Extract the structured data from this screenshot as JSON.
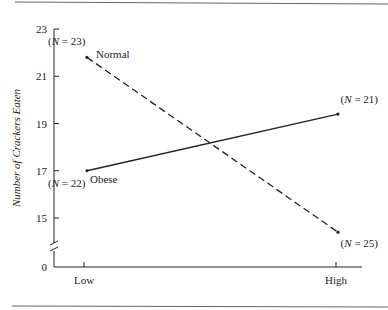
{
  "chart_data": {
    "type": "line",
    "title": "",
    "xlabel": "",
    "ylabel": "Number of Crackers Eaten",
    "categories": [
      "Low",
      "High"
    ],
    "series": [
      {
        "name": "Normal",
        "style": "dashed",
        "values": [
          21.8,
          14.4
        ],
        "n_labels": [
          "(N = 23)",
          "(N = 25)"
        ]
      },
      {
        "name": "Obese",
        "style": "solid",
        "values": [
          17.0,
          19.4
        ],
        "n_labels": [
          "(N = 22)",
          "(N = 21)"
        ]
      }
    ],
    "yticks": [
      0,
      15,
      17,
      19,
      21,
      23
    ],
    "ylim": [
      14,
      23
    ],
    "axis_break": true,
    "grid": false,
    "legend": "inline labels"
  }
}
